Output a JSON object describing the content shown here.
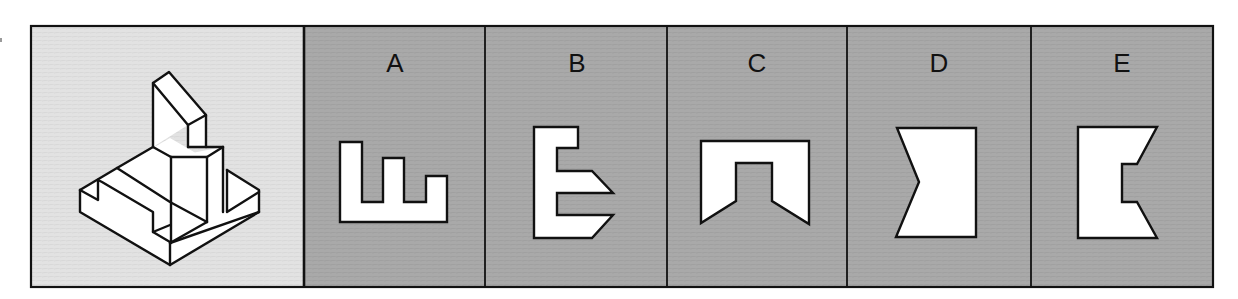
{
  "figure": {
    "colors": {
      "page_bg": "#ffffff",
      "reference_panel_bg": "#e2e2e2",
      "option_panel_bg": "#a9a9a9",
      "stroke": "#111111",
      "shape_fill": "#ffffff"
    },
    "frame": {
      "x": 31,
      "y": 26,
      "width": 1182,
      "height": 261
    },
    "reference_panel": {
      "label": "",
      "x": 31,
      "y": 26,
      "width": 273,
      "height": 261,
      "isometric_object": {
        "faces": [
          "80,190 170,138 259,190 259,212 170,265 80,212",
          "153,83 169,72 206,115 206,147 188,147 188,125 153,147",
          "171,157 223,147 223,212 207,222 171,202"
        ],
        "lines": [
          "153,83 169,72 206,115 188,125 153,83",
          "153,83 153,147",
          "188,125 188,147",
          "206,115 206,147",
          "153,147 171,157",
          "171,157 207,157 223,147",
          "188,147 223,147",
          "171,157 171,243",
          "207,157 207,222",
          "223,147 223,212",
          "153,147 117,168 80,190",
          "80,190 80,212 170,265 259,212 259,190 227,170",
          "227,170 227,212 259,192",
          "80,190 98,200 98,180",
          "98,180 102,182 153,212 153,232 170,242",
          "117,168 170,202 207,222",
          "153,232 170,225",
          "170,243 207,222",
          "170,243 170,265",
          "170,243 259,212"
        ]
      }
    },
    "options": [
      {
        "label": "A",
        "x": 304,
        "width": 181,
        "label_x": 395,
        "shape": "340,142 362,142 362,202 383,202 383,158 404,158 404,202 426,202 426,176 447,176 447,222 340,222"
      },
      {
        "label": "B",
        "x": 485,
        "width": 182,
        "label_x": 577,
        "shape": "534,127 578,127 578,148 557,148 557,171 592,171 613,193 557,193 557,215 613,215 592,238 534,238"
      },
      {
        "label": "C",
        "x": 667,
        "width": 180,
        "label_x": 757,
        "shape": "701,141 809,141 809,224 772,201 772,163 736,163 736,201 701,223"
      },
      {
        "label": "D",
        "x": 847,
        "width": 184,
        "label_x": 939,
        "shape": "897,128 976,128 976,237 896,237 919,182"
      },
      {
        "label": "E",
        "x": 1031,
        "width": 182,
        "label_x": 1122,
        "shape": "1078,127 1157,127 1137,164 1122,164 1122,202 1137,202 1157,238 1078,238"
      }
    ],
    "label_y": 72
  }
}
